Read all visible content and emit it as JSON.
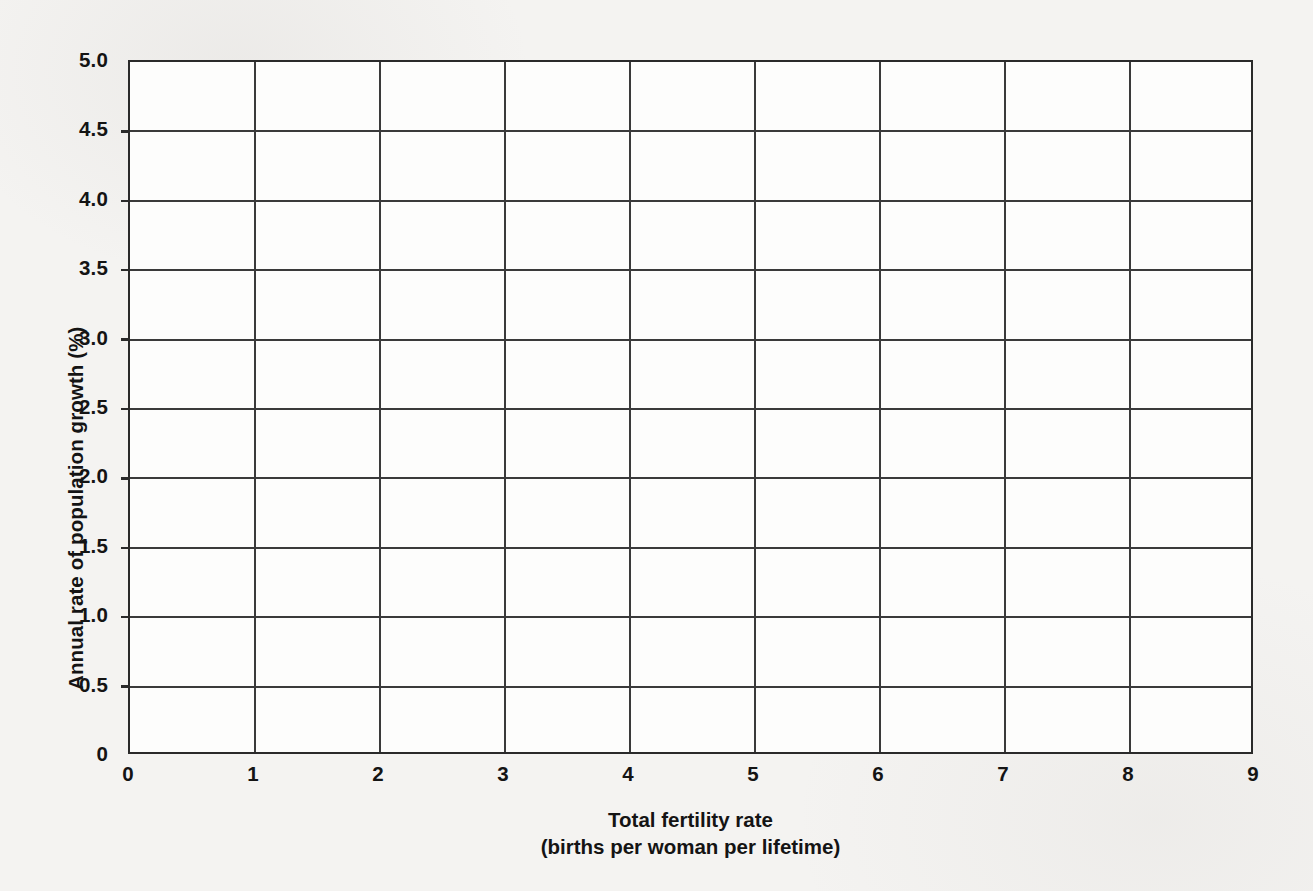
{
  "chart_data": {
    "type": "scatter",
    "title": "",
    "subtitle": "",
    "xlabel": "Total fertility rate",
    "xlabel_sub": "(births per woman per lifetime)",
    "ylabel": "Annual rate of population growth (%)",
    "xlim": [
      0,
      9
    ],
    "ylim": [
      0,
      5.0
    ],
    "x_tick_labels": [
      "0",
      "1",
      "2",
      "3",
      "4",
      "5",
      "6",
      "7",
      "8",
      "9"
    ],
    "x_tick_values": [
      0,
      1,
      2,
      3,
      4,
      5,
      6,
      7,
      8,
      9
    ],
    "y_tick_labels": [
      "0",
      "0.5",
      "1.0",
      "1.5",
      "2.0",
      "2.5",
      "3.0",
      "3.5",
      "4.0",
      "4.5",
      "5.0"
    ],
    "y_tick_values": [
      0,
      0.5,
      1.0,
      1.5,
      2.0,
      2.5,
      3.0,
      3.5,
      4.0,
      4.5,
      5.0
    ],
    "grid": true,
    "grid_x_values": [
      1,
      2,
      3,
      4,
      5,
      6,
      7,
      8
    ],
    "grid_y_values": [
      0.5,
      1.0,
      1.5,
      2.0,
      2.5,
      3.0,
      3.5,
      4.0,
      4.5
    ],
    "legend": null,
    "legend_position": "none",
    "series": [],
    "values": [],
    "annotations": []
  },
  "colors": {
    "page_background": "#f4f3f1",
    "plot_background": "#fdfdfc",
    "axis": "#2a2a2a",
    "gridline": "#3a3a3a",
    "text": "#141414"
  }
}
